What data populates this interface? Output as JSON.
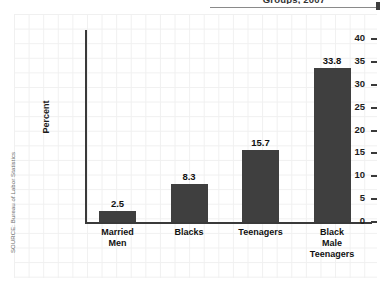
{
  "figure": {
    "title_clipped": "Groups, 2007",
    "source_note": "SOURCE: Bureau of Labor Statistics"
  },
  "chart_data": {
    "type": "bar",
    "title": "Groups, 2007",
    "xlabel": "",
    "ylabel": "Percent",
    "ylim": [
      0,
      42
    ],
    "yticks": [
      "0",
      "5",
      "10",
      "15",
      "20",
      "25",
      "30",
      "35",
      "40"
    ],
    "ytick_values": [
      0,
      5,
      10,
      15,
      20,
      25,
      30,
      35,
      40
    ],
    "grid": true,
    "legend": "none",
    "categories": [
      "Married Men",
      "Blacks",
      "Teenagers",
      "Black Male Teenagers"
    ],
    "category_lines": [
      [
        "Married",
        "Men"
      ],
      [
        "Blacks"
      ],
      [
        "Teenagers"
      ],
      [
        "Black",
        "Male",
        "Teenagers"
      ]
    ],
    "values": [
      2.5,
      8.3,
      15.7,
      33.8
    ],
    "value_labels": [
      "2.5",
      "8.3",
      "15.7",
      "33.8"
    ],
    "bar_color": "#3f3f3f",
    "axis_color": "#3a3a3a",
    "grid_color": "#f0f0f0",
    "background": "#ffffff"
  }
}
